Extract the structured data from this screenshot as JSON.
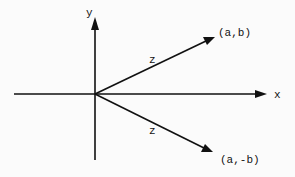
{
  "diagram": {
    "type": "complex-plane-conjugate-vectors",
    "axes": {
      "x_label": "x",
      "y_label": "y"
    },
    "vectors": [
      {
        "name": "z",
        "label": "z",
        "endpoint_label": "(a,b)"
      },
      {
        "name": "z-conjugate",
        "label": "z",
        "endpoint_label": "(a,-b)"
      }
    ],
    "colors": {
      "ink": "#111111",
      "paper": "#fbfbfb"
    }
  }
}
